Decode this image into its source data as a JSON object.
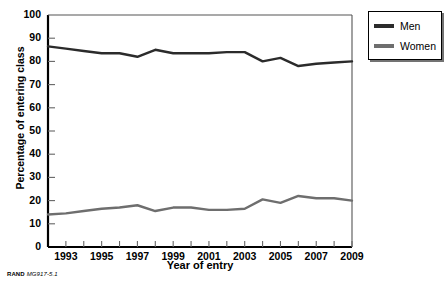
{
  "chart_data": {
    "type": "line",
    "title": "",
    "xlabel": "Year of entry",
    "ylabel": "Percentage of entering class",
    "xlim": [
      1992,
      2009
    ],
    "ylim": [
      0,
      100
    ],
    "ytick_values": [
      0,
      10,
      20,
      30,
      40,
      50,
      60,
      70,
      80,
      90,
      100
    ],
    "ytick_labels": [
      "0",
      "10",
      "20",
      "30",
      "40",
      "50",
      "60",
      "70",
      "80",
      "90",
      "100"
    ],
    "xtick_values": [
      1992,
      1993,
      1994,
      1995,
      1996,
      1997,
      1998,
      1999,
      2000,
      2001,
      2002,
      2003,
      2004,
      2005,
      2006,
      2007,
      2008,
      2009
    ],
    "xtick_labels": [
      "",
      "1993",
      "",
      "1995",
      "",
      "1997",
      "",
      "1999",
      "",
      "2001",
      "",
      "2003",
      "",
      "2005",
      "",
      "2007",
      "",
      "2009"
    ],
    "x": [
      1992,
      1993,
      1994,
      1995,
      1996,
      1997,
      1998,
      1999,
      2000,
      2001,
      2002,
      2003,
      2004,
      2005,
      2006,
      2007,
      2008,
      2009
    ],
    "grid": false,
    "legend_position": "outside-top-right",
    "series": [
      {
        "name": "Men",
        "color": "#2b2b2b",
        "values": [
          86.5,
          85.5,
          84.5,
          83.5,
          83.5,
          82.0,
          85.0,
          83.5,
          83.5,
          83.5,
          84.0,
          84.0,
          80.0,
          81.5,
          78.0,
          79.0,
          79.5,
          80.0
        ]
      },
      {
        "name": "Women",
        "color": "#6e6e6e",
        "values": [
          14.0,
          14.5,
          15.5,
          16.5,
          17.0,
          18.0,
          15.5,
          17.0,
          17.0,
          16.0,
          16.0,
          16.5,
          20.5,
          19.0,
          22.0,
          21.0,
          21.0,
          20.0
        ]
      }
    ]
  },
  "legend": {
    "items": [
      {
        "label": "Men",
        "color": "#2b2b2b"
      },
      {
        "label": "Women",
        "color": "#6e6e6e"
      }
    ]
  },
  "footer": {
    "source": "RAND",
    "figure_code": "MG917-5.1"
  }
}
